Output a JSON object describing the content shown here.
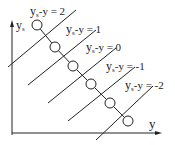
{
  "diagram": {
    "axes": {
      "vertical_label": "y",
      "vertical_subscript": "s",
      "horizontal_label": "y"
    },
    "lines": [
      {
        "c": "2",
        "label_main": "y",
        "label_sub": "s",
        "label_rest": "-y = 2",
        "x1": 8,
        "y1": 67,
        "x2": 76,
        "y2": 10,
        "lx": 30,
        "ly": 15
      },
      {
        "c": "1",
        "label_main": "y",
        "label_sub": "s",
        "label_rest": "-y = 1",
        "x1": 28,
        "y1": 85,
        "x2": 96,
        "y2": 30,
        "lx": 66,
        "ly": 33
      },
      {
        "c": "0",
        "label_main": "y",
        "label_sub": "s",
        "label_rest": "-y = 0",
        "x1": 48,
        "y1": 103,
        "x2": 116,
        "y2": 48,
        "lx": 86,
        "ly": 51
      },
      {
        "c": "-1",
        "label_main": "y",
        "label_sub": "s",
        "label_rest": "-y = -1",
        "x1": 68,
        "y1": 121,
        "x2": 135,
        "y2": 67,
        "lx": 106,
        "ly": 70
      },
      {
        "c": "-2",
        "label_main": "y",
        "label_sub": "s",
        "label_rest": "-y = -2",
        "x1": 96,
        "y1": 140,
        "x2": 153,
        "y2": 86,
        "lx": 125,
        "ly": 89
      }
    ],
    "circles": [
      {
        "cx": 37,
        "cy": 25
      },
      {
        "cx": 55,
        "cy": 47
      },
      {
        "cx": 73,
        "cy": 66
      },
      {
        "cx": 91,
        "cy": 84
      },
      {
        "cx": 110,
        "cy": 103
      },
      {
        "cx": 128,
        "cy": 121
      }
    ],
    "colors": {
      "stroke": "#222222",
      "background": "#ffffff"
    }
  }
}
